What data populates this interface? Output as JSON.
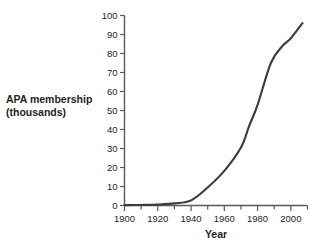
{
  "chart_data": {
    "type": "line",
    "title": "",
    "xlabel": "Year",
    "ylabel": "APA membership (thousands)",
    "ylabel_line1": "APA membership",
    "ylabel_line2": "(thousands)",
    "xlim": [
      1900,
      2010
    ],
    "ylim": [
      0,
      100
    ],
    "x_major_ticks": [
      1900,
      1920,
      1940,
      1960,
      1980,
      2000
    ],
    "x_minor_ticks": [
      1910,
      1930,
      1950,
      1970,
      1990,
      2010
    ],
    "x_tick_labels": [
      "1900",
      "1920",
      "1940",
      "1960",
      "1980",
      "2000"
    ],
    "y_ticks": [
      0,
      10,
      20,
      30,
      40,
      50,
      60,
      70,
      80,
      90,
      100
    ],
    "y_tick_labels": [
      "0",
      "10",
      "20",
      "30",
      "40",
      "50",
      "60",
      "70",
      "80",
      "90",
      "100"
    ],
    "grid": false,
    "legend": "none",
    "line_color": "#3c3c3c",
    "axis_color": "#58595b",
    "background_color": "#ffffff",
    "series": [
      {
        "name": "APA membership",
        "x": [
          1900,
          1910,
          1920,
          1930,
          1940,
          1950,
          1960,
          1970,
          1975,
          1980,
          1988,
          1995,
          2000,
          2007
        ],
        "values": [
          0.2,
          0.3,
          0.5,
          1.1,
          2.7,
          9.5,
          18.2,
          30.5,
          42,
          53,
          75,
          84,
          88,
          96
        ]
      }
    ]
  }
}
